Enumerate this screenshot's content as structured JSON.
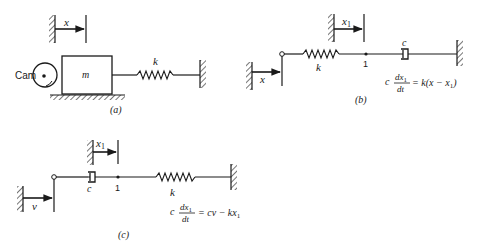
{
  "figures": [
    {
      "id": "a",
      "caption": "(a)",
      "labels": {
        "displacement": "x",
        "cam": "Cam",
        "mass": "m",
        "spring": "k"
      }
    },
    {
      "id": "b",
      "caption": "(b)",
      "labels": {
        "input_displacement": "x",
        "node_displacement": "x",
        "node_displacement_sub": "1",
        "spring": "k",
        "node": "1",
        "damper": "c"
      },
      "equation": {
        "coef": "c",
        "num": "dx",
        "num_sub": "1",
        "den": "dt",
        "rhs": "= k(x − x",
        "rhs_sub": "1",
        "rhs_close": ")"
      }
    },
    {
      "id": "c",
      "caption": "(c)",
      "labels": {
        "input_velocity": "v",
        "node_displacement": "x",
        "node_displacement_sub": "1",
        "damper": "c",
        "node": "1",
        "spring": "k"
      },
      "equation": {
        "coef": "c",
        "num": "dx",
        "num_sub": "1",
        "den": "dt",
        "rhs": "= cv − kx",
        "rhs_sub": "1"
      }
    }
  ]
}
